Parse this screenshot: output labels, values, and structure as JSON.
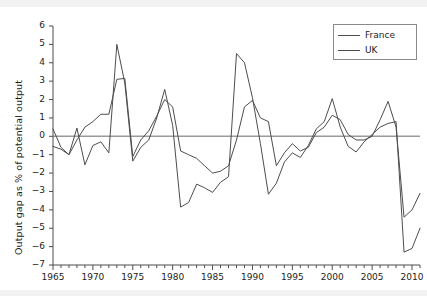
{
  "chart_data": {
    "type": "line",
    "title": "",
    "xlabel": "",
    "ylabel": "Output gap as % of potential output",
    "xlim": [
      1965,
      2011
    ],
    "ylim": [
      -7,
      6
    ],
    "grid": false,
    "zero_line": true,
    "legend_position": "upper-right",
    "x_tick_labels": [
      "1965",
      "1970",
      "1975",
      "1980",
      "1985",
      "1990",
      "1995",
      "2000",
      "2005",
      "2010"
    ],
    "x_major_ticks": [
      1965,
      1970,
      1975,
      1980,
      1985,
      1990,
      1995,
      2000,
      2005,
      2010
    ],
    "x_minor_tick_step": 1,
    "y_tick_labels": [
      "6",
      "5",
      "4",
      "3",
      "2",
      "1",
      "0",
      "-1",
      "-2",
      "-3",
      "-4",
      "-5",
      "-6",
      "-7"
    ],
    "y_ticks": [
      6,
      5,
      4,
      3,
      2,
      1,
      0,
      -1,
      -2,
      -3,
      -4,
      -5,
      -6,
      -7
    ],
    "x": [
      1965,
      1966,
      1967,
      1968,
      1969,
      1970,
      1971,
      1972,
      1973,
      1974,
      1975,
      1976,
      1977,
      1978,
      1979,
      1980,
      1981,
      1982,
      1983,
      1984,
      1985,
      1986,
      1987,
      1988,
      1989,
      1990,
      1991,
      1992,
      1993,
      1994,
      1995,
      1996,
      1997,
      1998,
      1999,
      2000,
      2001,
      2002,
      2003,
      2004,
      2005,
      2006,
      2007,
      2008,
      2009,
      2010,
      2011
    ],
    "series": [
      {
        "name": "France",
        "color": "#4d4d4d",
        "values": [
          0.4,
          -0.6,
          -1.0,
          -0.2,
          0.5,
          0.8,
          1.2,
          1.2,
          3.1,
          3.15,
          -1.1,
          -0.2,
          0.3,
          1.1,
          2.0,
          1.6,
          -0.8,
          -1.0,
          -1.2,
          -1.6,
          -2.0,
          -1.9,
          -1.6,
          -0.2,
          1.6,
          1.95,
          1.0,
          0.8,
          -1.6,
          -0.9,
          -0.4,
          -0.8,
          -0.6,
          0.2,
          0.5,
          1.15,
          0.9,
          0.1,
          -0.2,
          -0.2,
          0.0,
          0.9,
          1.9,
          0.5,
          -4.4,
          -4.0,
          -3.1
        ]
      },
      {
        "name": "UK",
        "color": "#4d4d4d",
        "values": [
          -0.55,
          -0.7,
          -1.0,
          0.45,
          -1.55,
          -0.5,
          -0.3,
          -0.9,
          5.0,
          2.9,
          -1.35,
          -0.6,
          -0.2,
          1.0,
          2.55,
          0.6,
          -3.85,
          -3.6,
          -2.6,
          -2.8,
          -3.05,
          -2.5,
          -2.2,
          4.5,
          4.0,
          2.1,
          -0.4,
          -3.15,
          -2.55,
          -1.4,
          -0.9,
          -1.15,
          -0.5,
          0.4,
          0.8,
          2.05,
          0.5,
          -0.55,
          -0.85,
          -0.3,
          0.1,
          0.5,
          0.7,
          0.8,
          -6.3,
          -6.1,
          -5.0
        ]
      }
    ]
  },
  "legend": {
    "items": [
      {
        "label": "France"
      },
      {
        "label": "UK"
      }
    ]
  },
  "colors": {
    "line": "#4d4d4d",
    "axis": "#4d4d4d",
    "zero_line": "#9a9a9a",
    "text": "#1c1c1c",
    "background": "#ffffff",
    "band": "#f2f2f2"
  }
}
